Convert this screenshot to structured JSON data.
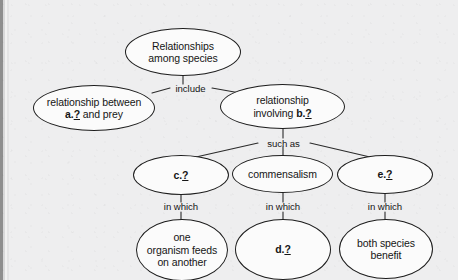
{
  "diagram": {
    "type": "concept-map",
    "title": "Relationships among species",
    "background_color": "#eeeeef",
    "node_fill": "#fbfbfb",
    "node_stroke": "#1d1d1d",
    "nodes": [
      {
        "id": "root",
        "line1": "Relationships",
        "line2": "among species"
      },
      {
        "id": "predator-prey",
        "line1": "relationship between",
        "pre2": "a.",
        "blank2": "?",
        "post2": " and prey"
      },
      {
        "id": "symbiosis",
        "line1": "relationship",
        "pre2": "involving ",
        "prefix2": "b.",
        "blank2": "?"
      },
      {
        "id": "c-blank",
        "prefix": "c.",
        "blank": "?"
      },
      {
        "id": "commensalism",
        "line1": "commensalism"
      },
      {
        "id": "e-blank",
        "prefix": "e.",
        "blank": "?"
      },
      {
        "id": "predation-def",
        "line1": "one",
        "line2": "organism feeds",
        "line3": "on another"
      },
      {
        "id": "d-blank",
        "prefix": "d.",
        "blank": "?"
      },
      {
        "id": "mutualism-def",
        "line1": "both species",
        "line2": "benefit"
      }
    ],
    "connector_labels": {
      "include": "include",
      "such_as": "such as",
      "in_which_left": "in which",
      "in_which_center": "in which",
      "in_which_right": "in which"
    }
  }
}
